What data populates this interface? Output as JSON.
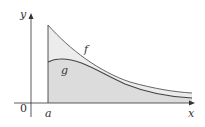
{
  "diagram": {
    "axes": {
      "x_label": "x",
      "y_label": "y",
      "origin_label": "0"
    },
    "curves": [
      {
        "name": "f",
        "label": "f",
        "description": "upper decreasing curve starting at x=a"
      },
      {
        "name": "g",
        "label": "g",
        "description": "lower curve with small hump, below f"
      }
    ],
    "marker": {
      "label": "a",
      "description": "vertical line x = a bounding region"
    },
    "regions": [
      {
        "name": "between-f-and-g",
        "color": "#ececec"
      },
      {
        "name": "under-g",
        "color": "#dcdcdc"
      }
    ],
    "colors": {
      "axis": "#333333",
      "curve": "#444444"
    }
  }
}
